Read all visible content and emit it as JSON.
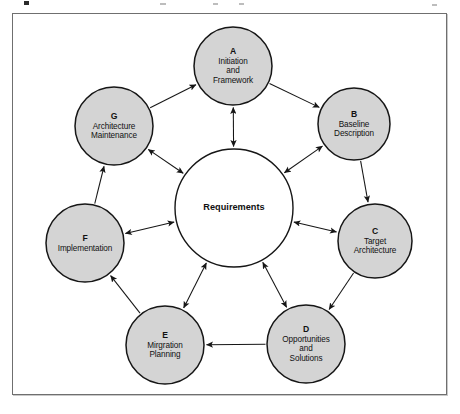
{
  "diagram": {
    "frame": {
      "border_color": "#6f6f6f",
      "background": "#ffffff"
    },
    "style": {
      "node_fill": "#d4d4d4",
      "node_stroke": "#161616",
      "center_fill": "#ffffff",
      "center_stroke": "#161616",
      "arrow_color": "#161616",
      "text_color": "#111111"
    },
    "center": {
      "id": "requirements",
      "label": "Requirements",
      "cx": 234,
      "cy": 208,
      "r": 59
    },
    "nodes": [
      {
        "id": "A",
        "key": "A",
        "lines": [
          "Initiation",
          "and",
          "Framework"
        ],
        "cx": 233,
        "cy": 66,
        "r": 39
      },
      {
        "id": "B",
        "key": "B",
        "lines": [
          "Baseline",
          "Description"
        ],
        "cx": 354,
        "cy": 124,
        "r": 36
      },
      {
        "id": "C",
        "key": "C",
        "lines": [
          "Target",
          "Architecture"
        ],
        "cx": 375,
        "cy": 241,
        "r": 37
      },
      {
        "id": "D",
        "key": "D",
        "lines": [
          "Opportunities",
          "and",
          "Solutions"
        ],
        "cx": 306,
        "cy": 344,
        "r": 39
      },
      {
        "id": "E",
        "key": "E",
        "lines": [
          "Mirgration",
          "Planning"
        ],
        "cx": 165,
        "cy": 345,
        "r": 39
      },
      {
        "id": "F",
        "key": "F",
        "lines": [
          "Implementation"
        ],
        "cx": 85,
        "cy": 243,
        "r": 39
      },
      {
        "id": "G",
        "key": "G",
        "lines": [
          "Architecture",
          "Maintenance"
        ],
        "cx": 114,
        "cy": 126,
        "r": 39
      }
    ],
    "ring_edges": [
      {
        "from": "G",
        "to": "A",
        "arrows": "end"
      },
      {
        "from": "A",
        "to": "B",
        "arrows": "end"
      },
      {
        "from": "B",
        "to": "C",
        "arrows": "end"
      },
      {
        "from": "C",
        "to": "D",
        "arrows": "end"
      },
      {
        "from": "D",
        "to": "E",
        "arrows": "end"
      },
      {
        "from": "E",
        "to": "F",
        "arrows": "end"
      },
      {
        "from": "F",
        "to": "G",
        "arrows": "end"
      }
    ],
    "spoke_edges": [
      {
        "from": "A",
        "to": "requirements",
        "arrows": "both"
      },
      {
        "from": "B",
        "to": "requirements",
        "arrows": "both"
      },
      {
        "from": "C",
        "to": "requirements",
        "arrows": "both"
      },
      {
        "from": "D",
        "to": "requirements",
        "arrows": "both"
      },
      {
        "from": "E",
        "to": "requirements",
        "arrows": "both"
      },
      {
        "from": "F",
        "to": "requirements",
        "arrows": "both"
      },
      {
        "from": "G",
        "to": "requirements",
        "arrows": "both"
      }
    ]
  }
}
